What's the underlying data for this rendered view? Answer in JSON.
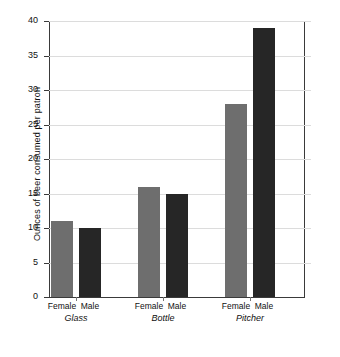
{
  "chart_data": {
    "type": "bar",
    "title": "",
    "xlabel": "",
    "ylabel": "Ounces of beer consumed per patron",
    "ylim": [
      0,
      40
    ],
    "y_ticks": [
      0,
      5,
      10,
      15,
      20,
      25,
      30,
      35,
      40
    ],
    "grid": true,
    "legend_position": "none",
    "categories": [
      "Glass",
      "Bottle",
      "Pitcher"
    ],
    "sub_categories": [
      "Female",
      "Male"
    ],
    "series": [
      {
        "name": "Female",
        "color": "#6e6e6e",
        "values": [
          11,
          16,
          28
        ]
      },
      {
        "name": "Male",
        "color": "#262626",
        "values": [
          10,
          15,
          39
        ]
      }
    ],
    "bars": [
      {
        "group": "Glass",
        "sub": "Female",
        "value": 11
      },
      {
        "group": "Glass",
        "sub": "Male",
        "value": 10
      },
      {
        "group": "Bottle",
        "sub": "Female",
        "value": 16
      },
      {
        "group": "Bottle",
        "sub": "Male",
        "value": 15
      },
      {
        "group": "Pitcher",
        "sub": "Female",
        "value": 28
      },
      {
        "group": "Pitcher",
        "sub": "Male",
        "value": 39
      }
    ]
  },
  "axis": {
    "y_title": "Ounces of beer consumed per patron",
    "y_tick_labels": [
      "0",
      "5",
      "10",
      "15",
      "20",
      "25",
      "30",
      "35",
      "40"
    ]
  },
  "groups": [
    {
      "label": "Glass",
      "female_label": "Female",
      "male_label": "Male"
    },
    {
      "label": "Bottle",
      "female_label": "Female",
      "male_label": "Male"
    },
    {
      "label": "Pitcher",
      "female_label": "Female",
      "male_label": "Male"
    }
  ],
  "colors": {
    "female_bar": "#6e6e6e",
    "male_bar": "#262626",
    "gridline": "#dcdcdc",
    "axis": "#3a3a3a",
    "background": "#ffffff"
  }
}
